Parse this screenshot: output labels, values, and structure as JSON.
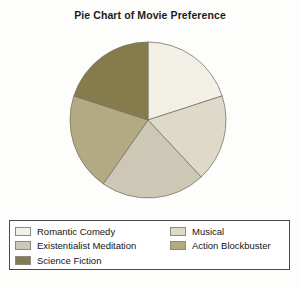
{
  "chart_data": {
    "type": "pie",
    "title": "Pie Chart of Movie Preference",
    "xlabel": "",
    "ylabel": "",
    "legend_position": "bottom",
    "grid": false,
    "start_angle_deg": 90,
    "direction": "clockwise",
    "categories": [
      "Romantic Comedy",
      "Musical",
      "Existentialist Meditation",
      "Action Blockbuster",
      "Science Fiction"
    ],
    "values": [
      20,
      18,
      22,
      20,
      20
    ],
    "colors": [
      "#f2f0e6",
      "#ded9c8",
      "#cdc8b6",
      "#b3a983",
      "#857b4b"
    ],
    "slices": [
      {
        "label": "Romantic Comedy",
        "value": 20,
        "color": "#f2f0e6",
        "start_deg": 0,
        "end_deg": 72
      },
      {
        "label": "Musical",
        "value": 18,
        "color": "#ded9c8",
        "start_deg": 72,
        "end_deg": 137
      },
      {
        "label": "Existentialist Meditation",
        "value": 22,
        "color": "#cdc8b6",
        "start_deg": 137,
        "end_deg": 215
      },
      {
        "label": "Action Blockbuster",
        "value": 20,
        "color": "#b3a983",
        "start_deg": 215,
        "end_deg": 288
      },
      {
        "label": "Science Fiction",
        "value": 20,
        "color": "#857b4b",
        "start_deg": 288,
        "end_deg": 360
      }
    ]
  },
  "chart": {
    "title": "Pie Chart of Movie Preference",
    "center_x": 148,
    "center_y": 98,
    "radius": 78,
    "edge_color": "#7a7568",
    "background": "#fdfdfc"
  },
  "legend": {
    "border_color": "#4a4a4a",
    "columns": [
      {
        "entries": [
          {
            "label": "Romantic Comedy",
            "color": "#f2f0e6"
          },
          {
            "label": "Existentialist Meditation",
            "color": "#cdc8b6"
          },
          {
            "label": "Science Fiction",
            "color": "#857b4b"
          }
        ]
      },
      {
        "entries": [
          {
            "label": "Musical",
            "color": "#ded9c8"
          },
          {
            "label": "Action Blockbuster",
            "color": "#b3a983"
          }
        ]
      }
    ]
  }
}
